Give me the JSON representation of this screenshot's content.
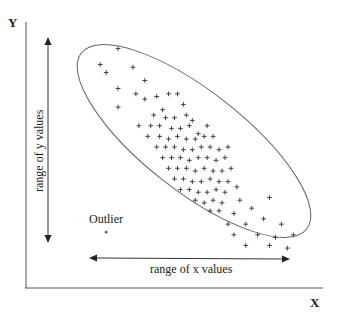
{
  "chart_data": {
    "type": "scatter",
    "title": "",
    "xlabel": "X",
    "ylabel": "Y",
    "xlim": [
      0,
      100
    ],
    "ylim": [
      0,
      100
    ],
    "grid": false,
    "legend": "none",
    "ticks": {
      "x": [],
      "y": []
    },
    "annotations": {
      "y_range": "range of y values",
      "x_range": "range of x values",
      "outlier": "Outlier"
    },
    "caption_partial": "",
    "ellipse": {
      "center": [
        57,
        54
      ],
      "enclosing": "main cluster",
      "orientation": "negative slope"
    },
    "outlier_point": {
      "x": 27,
      "y": 21
    },
    "series": [
      {
        "name": "observations",
        "marker": "+",
        "points": [
          {
            "x": 31,
            "y": 90
          },
          {
            "x": 25,
            "y": 84
          },
          {
            "x": 27,
            "y": 81
          },
          {
            "x": 36,
            "y": 83
          },
          {
            "x": 40,
            "y": 78
          },
          {
            "x": 31,
            "y": 75
          },
          {
            "x": 37,
            "y": 73
          },
          {
            "x": 40,
            "y": 71
          },
          {
            "x": 44,
            "y": 72
          },
          {
            "x": 48,
            "y": 73
          },
          {
            "x": 51,
            "y": 73
          },
          {
            "x": 31,
            "y": 68
          },
          {
            "x": 46,
            "y": 67
          },
          {
            "x": 43,
            "y": 65
          },
          {
            "x": 50,
            "y": 64
          },
          {
            "x": 54,
            "y": 65
          },
          {
            "x": 38,
            "y": 61
          },
          {
            "x": 42,
            "y": 61
          },
          {
            "x": 45,
            "y": 61
          },
          {
            "x": 49,
            "y": 60
          },
          {
            "x": 52,
            "y": 60
          },
          {
            "x": 55,
            "y": 61
          },
          {
            "x": 41,
            "y": 57
          },
          {
            "x": 45,
            "y": 57
          },
          {
            "x": 48,
            "y": 56
          },
          {
            "x": 51,
            "y": 57
          },
          {
            "x": 54,
            "y": 56
          },
          {
            "x": 57,
            "y": 56
          },
          {
            "x": 60,
            "y": 57
          },
          {
            "x": 44,
            "y": 53
          },
          {
            "x": 47,
            "y": 53
          },
          {
            "x": 50,
            "y": 53
          },
          {
            "x": 53,
            "y": 52
          },
          {
            "x": 56,
            "y": 52
          },
          {
            "x": 59,
            "y": 53
          },
          {
            "x": 62,
            "y": 53
          },
          {
            "x": 65,
            "y": 52
          },
          {
            "x": 46,
            "y": 49
          },
          {
            "x": 49,
            "y": 49
          },
          {
            "x": 52,
            "y": 49
          },
          {
            "x": 55,
            "y": 48
          },
          {
            "x": 58,
            "y": 49
          },
          {
            "x": 61,
            "y": 49
          },
          {
            "x": 64,
            "y": 48
          },
          {
            "x": 67,
            "y": 49
          },
          {
            "x": 48,
            "y": 45
          },
          {
            "x": 51,
            "y": 45
          },
          {
            "x": 54,
            "y": 45
          },
          {
            "x": 57,
            "y": 44
          },
          {
            "x": 60,
            "y": 45
          },
          {
            "x": 63,
            "y": 44
          },
          {
            "x": 66,
            "y": 44
          },
          {
            "x": 69,
            "y": 45
          },
          {
            "x": 50,
            "y": 41
          },
          {
            "x": 53,
            "y": 41
          },
          {
            "x": 56,
            "y": 40
          },
          {
            "x": 59,
            "y": 40
          },
          {
            "x": 62,
            "y": 41
          },
          {
            "x": 65,
            "y": 40
          },
          {
            "x": 68,
            "y": 40
          },
          {
            "x": 52,
            "y": 37
          },
          {
            "x": 55,
            "y": 37
          },
          {
            "x": 58,
            "y": 36
          },
          {
            "x": 61,
            "y": 36
          },
          {
            "x": 64,
            "y": 37
          },
          {
            "x": 67,
            "y": 36
          },
          {
            "x": 71,
            "y": 38
          },
          {
            "x": 57,
            "y": 33
          },
          {
            "x": 60,
            "y": 32
          },
          {
            "x": 63,
            "y": 33
          },
          {
            "x": 66,
            "y": 32
          },
          {
            "x": 72,
            "y": 33
          },
          {
            "x": 62,
            "y": 29
          },
          {
            "x": 65,
            "y": 29
          },
          {
            "x": 70,
            "y": 28
          },
          {
            "x": 76,
            "y": 30
          },
          {
            "x": 82,
            "y": 34
          },
          {
            "x": 68,
            "y": 24
          },
          {
            "x": 74,
            "y": 24
          },
          {
            "x": 80,
            "y": 26
          },
          {
            "x": 86,
            "y": 24
          },
          {
            "x": 70,
            "y": 20
          },
          {
            "x": 78,
            "y": 20
          },
          {
            "x": 84,
            "y": 19
          },
          {
            "x": 90,
            "y": 20
          },
          {
            "x": 74,
            "y": 16
          },
          {
            "x": 82,
            "y": 16
          },
          {
            "x": 88,
            "y": 15
          },
          {
            "x": 58,
            "y": 58
          },
          {
            "x": 53,
            "y": 69
          },
          {
            "x": 47,
            "y": 64
          },
          {
            "x": 61,
            "y": 61
          },
          {
            "x": 56,
            "y": 63
          },
          {
            "x": 63,
            "y": 57
          },
          {
            "x": 68,
            "y": 53
          }
        ]
      }
    ]
  }
}
